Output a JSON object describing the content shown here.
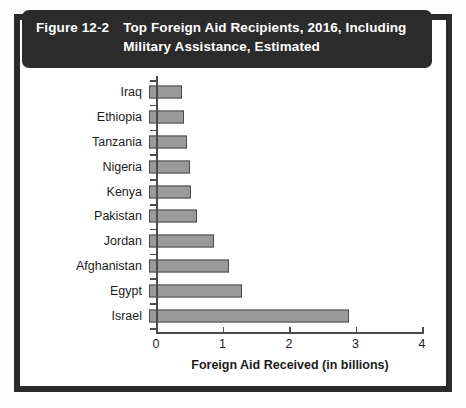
{
  "header": {
    "figure_number": "Figure 12-2",
    "title": "Top Foreign Aid Recipients, 2016, Including Military Assistance, Estimated"
  },
  "colors": {
    "frame": "#2b2b2b",
    "banner": "#2b2b2b",
    "bar_fill": "#9a9a9a",
    "bar_stroke": "#4a4a4a",
    "axis": "#4a4a4a",
    "text": "#1c1c1c",
    "panel": "#ffffff"
  },
  "chart_data": {
    "type": "bar",
    "orientation": "horizontal",
    "title": "Top Foreign Aid Recipients, 2016, Including Military Assistance, Estimated",
    "xlabel": "Foreign Aid Received (in billions)",
    "ylabel": "",
    "xlim": [
      0,
      4
    ],
    "xticks": [
      0,
      1,
      2,
      3,
      4
    ],
    "xtick_labels": [
      "0",
      "1",
      "2",
      "3",
      "4"
    ],
    "grid": false,
    "legend": false,
    "categories": [
      "Iraq",
      "Ethiopia",
      "Tanzania",
      "Nigeria",
      "Kenya",
      "Pakistan",
      "Jordan",
      "Afghanistan",
      "Egypt",
      "Israel"
    ],
    "values": [
      0.5,
      0.52,
      0.57,
      0.62,
      0.63,
      0.72,
      0.97,
      1.2,
      1.4,
      3.0
    ]
  }
}
